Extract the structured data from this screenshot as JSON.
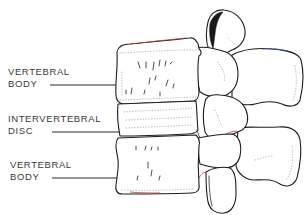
{
  "figure": {
    "labels": [
      {
        "id": "upper-vertebral-body",
        "line1": "VERTEBRAL",
        "line2": "BODY"
      },
      {
        "id": "intervertebral-disc",
        "line1": "INTERVERTEBRAL",
        "line2": "DISC"
      },
      {
        "id": "lower-vertebral-body",
        "line1": "VERTEBRAL",
        "line2": "BODY"
      }
    ]
  },
  "colors": {
    "background": "#ffffff",
    "line": "#1e1e1e",
    "text": "#3a3a3a"
  }
}
